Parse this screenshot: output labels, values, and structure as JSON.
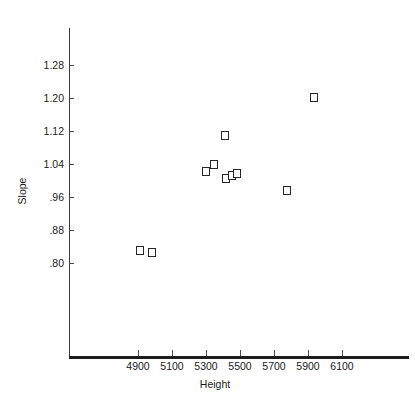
{
  "chart_data": {
    "type": "scatter",
    "title": "",
    "xlabel": "Height",
    "ylabel": "Slope",
    "grid": false,
    "legend": null,
    "xlim": [
      4750,
      6250
    ],
    "ylim": [
      0.74,
      1.32
    ],
    "x_ticks": [
      4900,
      5100,
      5300,
      5500,
      5700,
      5900,
      6100
    ],
    "x_tick_labels": [
      "4900",
      "5100",
      "5300",
      "5500",
      "5700",
      "5900",
      "6100"
    ],
    "y_ticks": [
      0.8,
      0.88,
      0.96,
      1.04,
      1.12,
      1.2,
      1.28
    ],
    "y_tick_labels": [
      ".80",
      ".88",
      ".96",
      "1.04",
      "1.12",
      "1.20",
      "1.28"
    ],
    "marker": "open-square",
    "marker_color": "#262626",
    "points": [
      {
        "x": 4910,
        "y": 0.831
      },
      {
        "x": 4982,
        "y": 0.826
      },
      {
        "x": 5300,
        "y": 1.023
      },
      {
        "x": 5347,
        "y": 1.039
      },
      {
        "x": 5409,
        "y": 1.108
      },
      {
        "x": 5418,
        "y": 1.006
      },
      {
        "x": 5453,
        "y": 1.013
      },
      {
        "x": 5482,
        "y": 1.016
      },
      {
        "x": 5774,
        "y": 0.975
      },
      {
        "x": 5933,
        "y": 1.201
      }
    ]
  },
  "axes": {
    "x_title": "Height",
    "y_title": "Slope"
  }
}
